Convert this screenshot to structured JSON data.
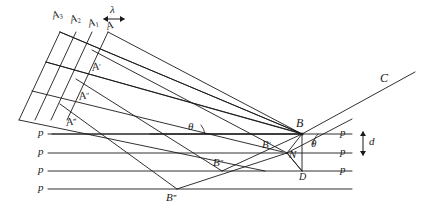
{
  "figure": {
    "type": "geometry-diagram",
    "background": "#ffffff",
    "ink": "#1a1a1a",
    "width": 433,
    "height": 212
  },
  "labels": {
    "a3": "A",
    "a3_sub": "3",
    "a2": "A",
    "a2_sub": "2",
    "a1": "A",
    "a1_sub": "1",
    "a0": "A",
    "lambda": "λ",
    "a_prime": "A",
    "a_prime_marks": "′",
    "a_dprime": "A",
    "a_dprime_marks": "″",
    "a_tprime": "A",
    "a_tprime_marks": "‴",
    "b": "B",
    "b_prime": "B",
    "b_prime_marks": "′",
    "b_dprime": "B",
    "b_dprime_marks": "″",
    "b_tprime": "B",
    "b_tprime_marks": "‴",
    "c": "C",
    "d": "d",
    "n": "N",
    "dee": "D",
    "theta_left": "θ",
    "theta_right": "θ",
    "p1": "p",
    "p2": "p",
    "p3": "p",
    "p4": "p",
    "p_r1": "p",
    "p_r2": "p",
    "p_r3": "p"
  }
}
